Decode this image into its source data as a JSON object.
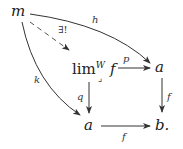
{
  "diagram": {
    "type": "commutative-diagram",
    "nodes": {
      "m": {
        "label": "m"
      },
      "lim": {
        "prefix": "lim",
        "superscript": "W",
        "arg": "f",
        "corner": "⌟"
      },
      "a_right": {
        "label": "a"
      },
      "a_bottom": {
        "label": "a"
      },
      "b": {
        "label": "b."
      }
    },
    "arrows": {
      "h": {
        "label": "h",
        "from": "m",
        "to": "a_right",
        "style": "solid-curved"
      },
      "unique": {
        "label": "∃!",
        "from": "m",
        "to": "lim",
        "style": "dashed"
      },
      "k": {
        "label": "k",
        "from": "m",
        "to": "a_bottom",
        "style": "solid-curved"
      },
      "p": {
        "label": "p",
        "from": "lim",
        "to": "a_right",
        "style": "solid"
      },
      "q": {
        "label": "q",
        "from": "lim",
        "to": "a_bottom",
        "style": "solid"
      },
      "f_right": {
        "label": "f",
        "from": "a_right",
        "to": "b",
        "style": "solid"
      },
      "f_bottom": {
        "label": "f",
        "from": "a_bottom",
        "to": "b",
        "style": "solid"
      }
    }
  }
}
